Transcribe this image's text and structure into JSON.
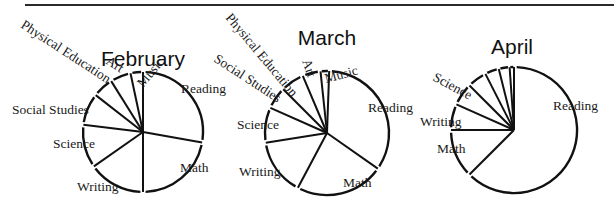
{
  "header": {
    "rule": true
  },
  "chart_data": [
    {
      "type": "pie",
      "title": "February",
      "start_angle_deg": 0,
      "direction": "clockwise",
      "center": [
        143,
        132
      ],
      "radius": 60,
      "categories": [
        "Reading",
        "Math",
        "Writing",
        "Science",
        "Social Studies",
        "Physical Education",
        "Art",
        "Music"
      ],
      "angles_deg": [
        100,
        80,
        55,
        42,
        31,
        20,
        20,
        12
      ],
      "values_percent": [
        27.8,
        22.2,
        15.3,
        11.7,
        8.6,
        5.6,
        5.6,
        3.3
      ],
      "labels": [
        {
          "text": "Reading",
          "x": 181,
          "y": 93,
          "rot": 0,
          "anchor": "start"
        },
        {
          "text": "Math",
          "x": 180,
          "y": 172,
          "rot": 0,
          "anchor": "start"
        },
        {
          "text": "Writing",
          "x": 77,
          "y": 191,
          "rot": 0,
          "anchor": "start"
        },
        {
          "text": "Science",
          "x": 53,
          "y": 148,
          "rot": 0,
          "anchor": "start"
        },
        {
          "text": "Social Studies",
          "x": 12,
          "y": 114,
          "rot": 0,
          "anchor": "start"
        },
        {
          "text": "Physical Education",
          "x": 20,
          "y": 27,
          "rot": 33,
          "anchor": "start"
        },
        {
          "text": "Art",
          "x": 105,
          "y": 63,
          "rot": 33,
          "anchor": "start"
        },
        {
          "text": "Music",
          "x": 143,
          "y": 88,
          "rot": -50,
          "anchor": "start"
        }
      ]
    },
    {
      "type": "pie",
      "title": "March",
      "start_angle_deg": 2,
      "direction": "clockwise",
      "center": [
        327,
        133
      ],
      "radius": 62,
      "categories": [
        "Reading",
        "Math",
        "Writing",
        "Science",
        "Social Studies",
        "Physical Education",
        "Art",
        "Music"
      ],
      "angles_deg": [
        123,
        83,
        53,
        33,
        21,
        22,
        17,
        8
      ],
      "values_percent": [
        34.2,
        23.1,
        14.7,
        9.2,
        5.8,
        6.1,
        4.7,
        2.2
      ],
      "labels": [
        {
          "text": "Reading",
          "x": 368,
          "y": 112,
          "rot": 0,
          "anchor": "start"
        },
        {
          "text": "Math",
          "x": 343,
          "y": 187,
          "rot": 0,
          "anchor": "start"
        },
        {
          "text": "Writing",
          "x": 239,
          "y": 176,
          "rot": 0,
          "anchor": "start"
        },
        {
          "text": "Science",
          "x": 237,
          "y": 129,
          "rot": 0,
          "anchor": "start"
        },
        {
          "text": "Social Studies",
          "x": 213,
          "y": 61,
          "rot": 33,
          "anchor": "start"
        },
        {
          "text": "Physical Education",
          "x": 225,
          "y": 18,
          "rot": 50,
          "anchor": "start"
        },
        {
          "text": "Art",
          "x": 302,
          "y": 61,
          "rot": 70,
          "anchor": "start"
        },
        {
          "text": "Music",
          "x": 326,
          "y": 83,
          "rot": -15,
          "anchor": "start"
        }
      ]
    },
    {
      "type": "pie",
      "title": "April",
      "start_angle_deg": 0,
      "direction": "clockwise",
      "center": [
        514,
        130
      ],
      "radius": 63,
      "categories": [
        "Reading",
        "Math",
        "Writing",
        "Science",
        "(unlabeled)",
        "(unlabeled)",
        "(unlabeled)",
        "(unlabeled)"
      ],
      "angles_deg": [
        225,
        45,
        24,
        21,
        18,
        13,
        10,
        4
      ],
      "values_percent": [
        62.5,
        12.5,
        6.7,
        5.8,
        5.0,
        3.6,
        2.8,
        1.1
      ],
      "labels": [
        {
          "text": "Reading",
          "x": 553,
          "y": 110,
          "rot": 0,
          "anchor": "start"
        },
        {
          "text": "Math",
          "x": 437,
          "y": 153,
          "rot": 0,
          "anchor": "start"
        },
        {
          "text": "Writing",
          "x": 420,
          "y": 126,
          "rot": 0,
          "anchor": "start"
        },
        {
          "text": "Science",
          "x": 432,
          "y": 80,
          "rot": 28,
          "anchor": "start"
        }
      ]
    }
  ]
}
